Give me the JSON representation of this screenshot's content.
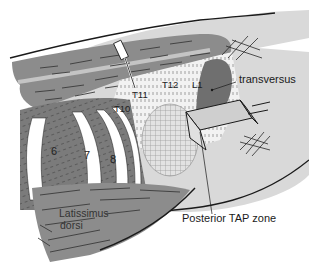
{
  "figure": {
    "colors": {
      "skin": "#d9d9d9",
      "muscle": "#8c8c8c",
      "muscle_dark": "#6f6f6f",
      "fascia_stripe": "#c4c4c4",
      "bone": "#ffffff",
      "outline": "#1a1a1a",
      "probe": "#cfcfcf"
    }
  },
  "labels": {
    "transversus": "transversus",
    "posterior_tap_zone": "Posterior TAP zone",
    "latissimus_line1": "Latissimus",
    "latissimus_line2": "dorsi"
  },
  "vertebrae": {
    "t10": "T10",
    "t11": "T11",
    "t12": "T12",
    "l1": "L1"
  },
  "ribs": {
    "r6": "6",
    "r7": "7",
    "r8": "8"
  }
}
